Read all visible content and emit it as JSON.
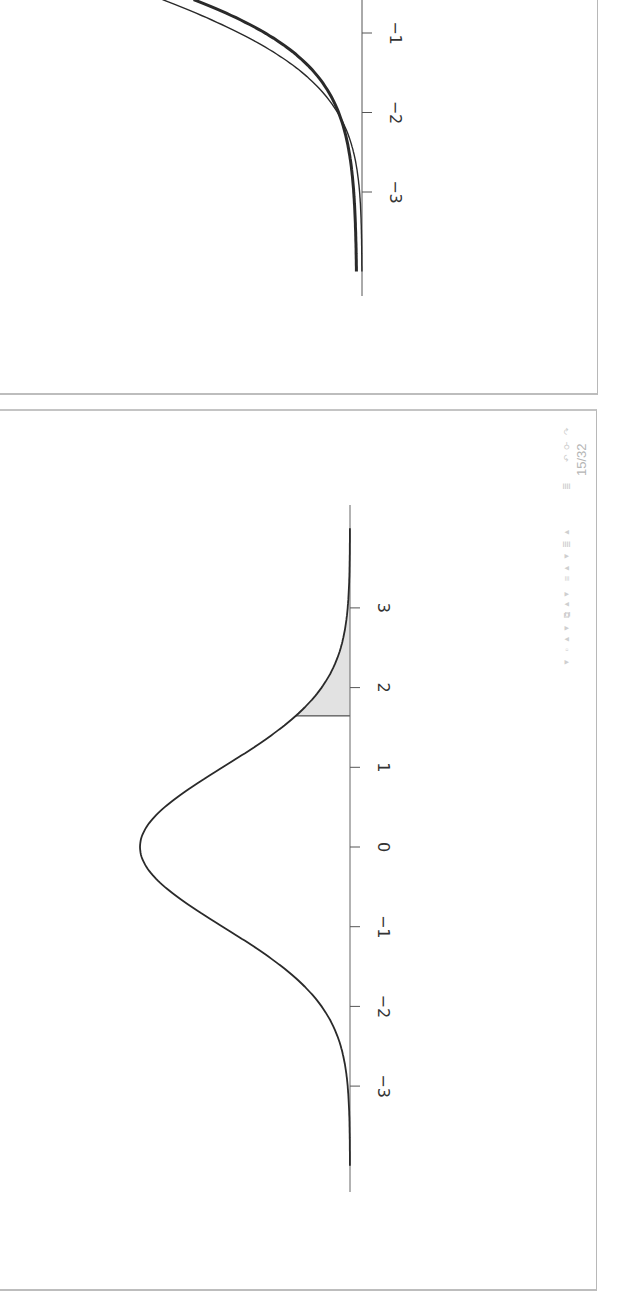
{
  "slide": {
    "page_current": "15",
    "page_separator": "/",
    "page_total": "32",
    "page_label": "15 / 32",
    "orientation": "rotated 90° clockwise"
  },
  "navigation": {
    "icons": [
      {
        "name": "first-frame-icon",
        "glyph": "◂"
      },
      {
        "name": "frame-icon",
        "glyph": "▫"
      },
      {
        "name": "next-frame-icon",
        "glyph": "▸"
      },
      {
        "name": "prev-subsection-icon",
        "glyph": "◂"
      },
      {
        "name": "subsection-icon",
        "glyph": "⧉"
      },
      {
        "name": "next-subsection-icon",
        "glyph": "▸"
      },
      {
        "name": "prev-section-icon",
        "glyph": "◂"
      },
      {
        "name": "section-icon",
        "glyph": "≡"
      },
      {
        "name": "next-section-icon",
        "glyph": "▸"
      },
      {
        "name": "prev-doc-icon",
        "glyph": "◂"
      },
      {
        "name": "doc-icon",
        "glyph": "≣"
      },
      {
        "name": "next-doc-icon",
        "glyph": "▸"
      },
      {
        "name": "appendix-icon",
        "glyph": "≣"
      },
      {
        "name": "back-icon",
        "glyph": "↶"
      },
      {
        "name": "search-icon",
        "glyph": "⚲"
      },
      {
        "name": "forward-icon",
        "glyph": "↷"
      }
    ]
  },
  "colors": {
    "curve": "#2a2a2a",
    "axis": "#555555",
    "shade": "#e2e2e2",
    "frame": "#bdbdbd",
    "nav": "#c9c9c9"
  },
  "chart_data": [
    {
      "type": "line",
      "title": "",
      "description": "Lower tail of two cumulative distribution curves (partial view, previous slide)",
      "xlabel": "",
      "ylabel": "",
      "x_ticks": [
        -3,
        -2,
        -1
      ],
      "xlim": [
        -4,
        -0.6
      ],
      "grid": false,
      "series": [
        {
          "name": "thin curve",
          "line_width": 1.3,
          "x": [
            -0.58,
            -0.9,
            -1.3,
            -1.7,
            -2.0,
            -2.5,
            -3.0,
            -3.5,
            -4.0
          ],
          "y": [
            0.28,
            0.2,
            0.12,
            0.065,
            0.038,
            0.014,
            0.003,
            0.0008,
            0.0
          ]
        },
        {
          "name": "thick curve",
          "line_width": 3.0,
          "x": [
            -0.58,
            -0.9,
            -1.3,
            -1.7,
            -2.0,
            -2.5,
            -3.0,
            -3.5,
            -4.0
          ],
          "y": [
            0.25,
            0.19,
            0.12,
            0.07,
            0.046,
            0.025,
            0.013,
            0.009,
            0.008
          ]
        }
      ]
    },
    {
      "type": "area",
      "title": "",
      "description": "Standard normal density with shaded upper tail (rejection region)",
      "xlabel": "",
      "ylabel": "",
      "x_ticks": [
        -3,
        -2,
        -1,
        0,
        1,
        2,
        3
      ],
      "xlim": [
        -4,
        4
      ],
      "ylim": [
        0,
        0.4
      ],
      "grid": false,
      "series": [
        {
          "name": "standard normal density",
          "x": [
            -4,
            -3.5,
            -3,
            -2.5,
            -2,
            -1.5,
            -1,
            -0.5,
            0,
            0.5,
            1,
            1.5,
            2,
            2.5,
            3,
            3.5,
            4
          ],
          "y": [
            0.0001,
            0.0009,
            0.0044,
            0.0175,
            0.054,
            0.1295,
            0.242,
            0.3521,
            0.3989,
            0.3521,
            0.242,
            0.1295,
            0.054,
            0.0175,
            0.0044,
            0.0009,
            0.0001
          ]
        }
      ],
      "shaded_region": {
        "from": 1.645,
        "to": 4,
        "fill": "#e2e2e2"
      }
    }
  ]
}
